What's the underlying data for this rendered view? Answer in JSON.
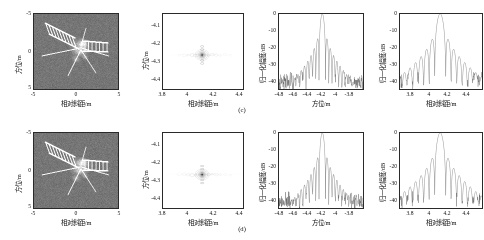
{
  "figure": {
    "caption_c": "(c)",
    "caption_d": "(d)"
  },
  "panels": {
    "sar": {
      "xlabel": "相对斜距/m",
      "ylabel": "方位/m",
      "xticks": [
        "-5",
        "0",
        "5"
      ],
      "yticks": [
        "-5",
        "0",
        "5"
      ],
      "xlim": [
        -5,
        5
      ],
      "ylim": [
        5,
        -5
      ],
      "image_name": "isar-satellite-image",
      "background_gray": "#787878"
    },
    "contour": {
      "xlabel": "相对斜距/m",
      "ylabel": "方位/m",
      "xticks": [
        "3.8",
        "4",
        "4.2",
        "4.4"
      ],
      "yticks": [
        "-4.1",
        "-4.2",
        "-4.3",
        "-4.4"
      ],
      "xlim": [
        3.8,
        4.4
      ],
      "ylim": [
        -4.05,
        -4.45
      ],
      "peak_x": 4.09,
      "peak_y": -4.27
    },
    "azimuth_profile": {
      "xlabel": "方位/m",
      "ylabel": "归一化幅度/dB",
      "xticks": [
        "-4.8",
        "-4.6",
        "-4.4",
        "-4.2",
        "-4",
        "-3.8"
      ],
      "yticks": [
        "0",
        "-10",
        "-20",
        "-30",
        "-40"
      ],
      "xlim": [
        -4.9,
        -3.7
      ],
      "ylim": [
        -45,
        0
      ],
      "peak_x": -4.27,
      "peak_y": 0
    },
    "range_profile": {
      "xlabel": "相对斜距/m",
      "ylabel": "归一化幅度/dB",
      "xticks": [
        "3.8",
        "4",
        "4.2",
        "4.4"
      ],
      "yticks": [
        "0",
        "-10",
        "-20",
        "-30",
        "-40"
      ],
      "xlim": [
        3.68,
        4.58
      ],
      "ylim": [
        -45,
        0
      ],
      "peak_x": 4.12,
      "peak_y": 0
    }
  },
  "chart_data": [
    {
      "type": "heatmap",
      "name": "isar-image-row-c",
      "title": "",
      "xlabel": "相对斜距/m",
      "ylabel": "方位/m",
      "xlim": [
        -5,
        5
      ],
      "ylim": [
        5,
        -5
      ],
      "xticks": [
        -5,
        0,
        5
      ],
      "yticks": [
        -5,
        0,
        5
      ],
      "description": "ISAR image of a satellite target: central body with two solar panels extending to upper-left and right, plus thin antenna booms",
      "grid": false,
      "legend": "none"
    },
    {
      "type": "scatter",
      "name": "point-target-contour-row-c",
      "title": "",
      "xlabel": "相对斜距/m",
      "ylabel": "方位/m",
      "xlim": [
        3.8,
        4.4
      ],
      "ylim": [
        -4.45,
        -4.05
      ],
      "xticks": [
        3.8,
        4.0,
        4.2,
        4.4
      ],
      "yticks": [
        -4.1,
        -4.2,
        -4.3,
        -4.4
      ],
      "x": [
        4.09
      ],
      "y": [
        -4.27
      ],
      "grid": false,
      "legend": "none"
    },
    {
      "type": "line",
      "name": "azimuth-psf-row-c",
      "title": "",
      "xlabel": "方位/m",
      "ylabel": "归一化幅度/dB",
      "xlim": [
        -4.9,
        -3.7
      ],
      "ylim": [
        -45,
        0
      ],
      "xticks": [
        -4.8,
        -4.6,
        -4.4,
        -4.2,
        -4.0,
        -3.8
      ],
      "yticks": [
        0,
        -10,
        -20,
        -30,
        -40
      ],
      "series": [
        {
          "name": "归一化幅度",
          "x": [
            -4.9,
            -4.8,
            -4.7,
            -4.6,
            -4.5,
            -4.45,
            -4.4,
            -4.35,
            -4.3,
            -4.28,
            -4.27,
            -4.26,
            -4.24,
            -4.2,
            -4.15,
            -4.1,
            -4.0,
            -3.9,
            -3.8,
            -3.7
          ],
          "values": [
            -38,
            -37,
            -36,
            -35,
            -33,
            -30,
            -26,
            -20,
            -10,
            -4,
            0,
            -4,
            -11,
            -21,
            -27,
            -31,
            -35,
            -37,
            -38,
            -38
          ]
        }
      ],
      "grid": false,
      "legend": "none"
    },
    {
      "type": "line",
      "name": "range-psf-row-c",
      "title": "",
      "xlabel": "相对斜距/m",
      "ylabel": "归一化幅度/dB",
      "xlim": [
        3.68,
        4.58
      ],
      "ylim": [
        -45,
        0
      ],
      "xticks": [
        3.8,
        4.0,
        4.2,
        4.4
      ],
      "yticks": [
        0,
        -10,
        -20,
        -30,
        -40
      ],
      "series": [
        {
          "name": "归一化幅度",
          "x": [
            3.7,
            3.8,
            3.9,
            4.0,
            4.05,
            4.08,
            4.1,
            4.12,
            4.14,
            4.16,
            4.2,
            4.25,
            4.3,
            4.4,
            4.5,
            4.58
          ],
          "values": [
            -38,
            -36,
            -33,
            -28,
            -18,
            -8,
            -2,
            0,
            -3,
            -9,
            -20,
            -26,
            -29,
            -33,
            -36,
            -38
          ]
        }
      ],
      "grid": false,
      "legend": "none"
    },
    {
      "type": "heatmap",
      "name": "isar-image-row-d",
      "title": "",
      "xlabel": "相对斜距/m",
      "ylabel": "方位/m",
      "xlim": [
        -5,
        5
      ],
      "ylim": [
        5,
        -5
      ],
      "xticks": [
        -5,
        0,
        5
      ],
      "yticks": [
        -5,
        0,
        5
      ],
      "description": "ISAR image of a satellite target, same scene as row (c)",
      "grid": false,
      "legend": "none"
    },
    {
      "type": "scatter",
      "name": "point-target-contour-row-d",
      "title": "",
      "xlabel": "相对斜距/m",
      "ylabel": "方位/m",
      "xlim": [
        3.8,
        4.4
      ],
      "ylim": [
        -4.45,
        -4.05
      ],
      "xticks": [
        3.8,
        4.0,
        4.2,
        4.4
      ],
      "yticks": [
        -4.1,
        -4.2,
        -4.3,
        -4.4
      ],
      "x": [
        4.09
      ],
      "y": [
        -4.265
      ],
      "grid": false,
      "legend": "none"
    },
    {
      "type": "line",
      "name": "azimuth-psf-row-d",
      "title": "",
      "xlabel": "方位/m",
      "ylabel": "归一化幅度/dB",
      "xlim": [
        -4.9,
        -3.7
      ],
      "ylim": [
        -45,
        0
      ],
      "xticks": [
        -4.8,
        -4.6,
        -4.4,
        -4.2,
        -4.0,
        -3.8
      ],
      "yticks": [
        0,
        -10,
        -20,
        -30,
        -40
      ],
      "series": [
        {
          "name": "归一化幅度",
          "x": [
            -4.9,
            -4.8,
            -4.7,
            -4.6,
            -4.5,
            -4.45,
            -4.4,
            -4.35,
            -4.3,
            -4.28,
            -4.27,
            -4.26,
            -4.24,
            -4.2,
            -4.15,
            -4.1,
            -4.0,
            -3.9,
            -3.8,
            -3.7
          ],
          "values": [
            -38,
            -37,
            -36,
            -35,
            -33,
            -30,
            -26,
            -20,
            -10,
            -4,
            0,
            -4,
            -11,
            -21,
            -27,
            -31,
            -35,
            -37,
            -38,
            -38
          ]
        }
      ],
      "grid": false,
      "legend": "none"
    },
    {
      "type": "line",
      "name": "range-psf-row-d",
      "title": "",
      "xlabel": "相对斜距/m",
      "ylabel": "归一化幅度/dB",
      "xlim": [
        3.68,
        4.58
      ],
      "ylim": [
        -45,
        0
      ],
      "xticks": [
        3.8,
        4.0,
        4.2,
        4.4
      ],
      "yticks": [
        0,
        -10,
        -20,
        -30,
        -40
      ],
      "series": [
        {
          "name": "归一化幅度",
          "x": [
            3.7,
            3.8,
            3.9,
            4.0,
            4.05,
            4.08,
            4.1,
            4.12,
            4.14,
            4.16,
            4.2,
            4.25,
            4.3,
            4.4,
            4.5,
            4.58
          ],
          "values": [
            -38,
            -36,
            -33,
            -28,
            -18,
            -8,
            -2,
            0,
            -3,
            -9,
            -20,
            -26,
            -29,
            -33,
            -36,
            -38
          ]
        }
      ],
      "grid": false,
      "legend": "none"
    }
  ]
}
